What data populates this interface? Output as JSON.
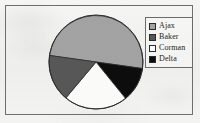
{
  "figure": {
    "background_color": "#f2f2f0",
    "frame_color": "#6e6e6e",
    "frame": {
      "x": 5,
      "y": 5,
      "width": 188,
      "height": 110
    }
  },
  "pie": {
    "center_x": 96,
    "center_y": 62,
    "radius": 47,
    "outline_color": "#2b2b2b"
  },
  "legend": {
    "position": "right",
    "border_color": "#6b6b6b",
    "items": [
      {
        "label": "Ajax",
        "color": "#a3a3a3",
        "swatch_name": "legend-swatch-ajax"
      },
      {
        "label": "Baker",
        "color": "#575757",
        "swatch_name": "legend-swatch-baker"
      },
      {
        "label": "Corman",
        "color": "#fbfbfa",
        "swatch_name": "legend-swatch-corman"
      },
      {
        "label": "Delta",
        "color": "#0d0d0d",
        "swatch_name": "legend-swatch-delta"
      }
    ]
  },
  "chart_data": {
    "type": "pie",
    "title": "",
    "subtitle": "",
    "xlabel": "",
    "ylabel": "",
    "grid": false,
    "legend_position": "right",
    "categories": [
      "Ajax",
      "Baker",
      "Corman",
      "Delta"
    ],
    "values": [
      50,
      16,
      22,
      12
    ],
    "value_unit": "percent",
    "colors": [
      "#a3a3a3",
      "#575757",
      "#fbfbfa",
      "#0d0d0d"
    ],
    "slices": [
      {
        "label": "Ajax",
        "percent": 50,
        "start_angle_deg": 188,
        "end_angle_deg": 368,
        "color": "#a3a3a3"
      },
      {
        "label": "Delta",
        "percent": 12,
        "start_angle_deg": 8,
        "end_angle_deg": 51,
        "color": "#0d0d0d"
      },
      {
        "label": "Corman",
        "percent": 22,
        "start_angle_deg": 51,
        "end_angle_deg": 130,
        "color": "#fbfbfa"
      },
      {
        "label": "Baker",
        "percent": 16,
        "start_angle_deg": 130,
        "end_angle_deg": 188,
        "color": "#575757"
      }
    ],
    "angle_convention": "degrees clockwise from 3 o'clock (screen y-down)",
    "annotations": []
  }
}
